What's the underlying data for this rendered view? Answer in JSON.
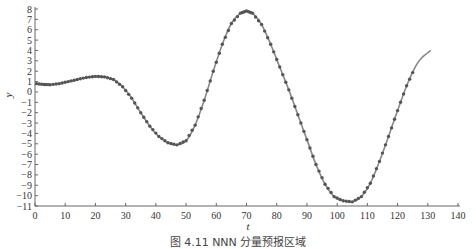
{
  "chart_data": {
    "type": "line",
    "title": "",
    "xlabel": "t",
    "ylabel": "y",
    "xlim": [
      0,
      140
    ],
    "ylim": [
      -11,
      8
    ],
    "xticks": [
      0,
      10,
      20,
      30,
      40,
      50,
      60,
      70,
      80,
      90,
      100,
      110,
      120,
      130,
      140
    ],
    "yticks": [
      8,
      7,
      6,
      5,
      4,
      3,
      2,
      1,
      0,
      -1,
      -2,
      -3,
      -4,
      -5,
      -6,
      -7,
      -8,
      -9,
      -10,
      -11
    ],
    "grid": false,
    "legend": null,
    "series": [
      {
        "name": "observed (markers)",
        "style": "markers",
        "color": "#555555",
        "x": [
          0.5,
          3,
          5,
          8,
          11,
          14,
          17,
          20,
          23,
          26,
          29,
          32,
          35,
          38,
          41,
          44,
          47,
          50,
          53,
          56,
          59,
          62,
          65,
          68,
          70,
          72,
          75,
          78,
          81,
          84,
          87,
          90,
          93,
          96,
          99,
          102,
          105,
          108,
          111,
          114,
          117,
          120,
          123,
          126
        ],
        "y": [
          0.8,
          0.72,
          0.7,
          0.8,
          1.0,
          1.2,
          1.4,
          1.5,
          1.45,
          1.2,
          0.5,
          -0.6,
          -2.0,
          -3.3,
          -4.3,
          -4.9,
          -5.1,
          -4.7,
          -3.2,
          -0.8,
          2.0,
          4.6,
          6.6,
          7.6,
          7.8,
          7.6,
          6.5,
          4.6,
          2.4,
          0.2,
          -2.2,
          -4.6,
          -7.0,
          -8.9,
          -10.1,
          -10.5,
          -10.6,
          -10.1,
          -8.8,
          -6.7,
          -4.3,
          -1.8,
          0.6,
          2.5
        ]
      },
      {
        "name": "predicted (line)",
        "style": "line",
        "color": "#888888",
        "x": [
          0.5,
          3,
          5,
          8,
          11,
          14,
          17,
          20,
          23,
          26,
          29,
          32,
          35,
          38,
          41,
          44,
          47,
          50,
          53,
          56,
          59,
          62,
          65,
          68,
          70,
          72,
          75,
          78,
          81,
          84,
          87,
          90,
          93,
          96,
          99,
          102,
          105,
          108,
          111,
          114,
          117,
          120,
          123,
          126,
          128,
          131
        ],
        "y": [
          0.8,
          0.72,
          0.7,
          0.8,
          1.0,
          1.2,
          1.4,
          1.5,
          1.45,
          1.2,
          0.5,
          -0.6,
          -2.0,
          -3.3,
          -4.3,
          -4.9,
          -5.1,
          -4.7,
          -3.2,
          -0.8,
          2.0,
          4.6,
          6.6,
          7.6,
          7.8,
          7.6,
          6.5,
          4.6,
          2.4,
          0.2,
          -2.2,
          -4.6,
          -7.0,
          -8.9,
          -10.1,
          -10.5,
          -10.6,
          -10.1,
          -8.8,
          -6.7,
          -4.3,
          -1.8,
          0.6,
          2.5,
          3.3,
          4.0
        ]
      }
    ]
  },
  "caption": "图 4.11   NNN 分量预报区域"
}
